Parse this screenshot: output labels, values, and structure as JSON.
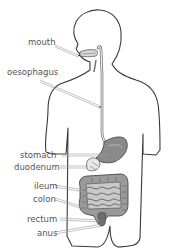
{
  "diagram": {
    "title": "",
    "type": "labelled anatomy diagram",
    "labels": [
      {
        "id": "mouth",
        "text": "mouth"
      },
      {
        "id": "oesophagus",
        "text": "oesophagus"
      },
      {
        "id": "stomach",
        "text": "stomach"
      },
      {
        "id": "duodenum",
        "text": "duodenum"
      },
      {
        "id": "ileum",
        "text": "ileum"
      },
      {
        "id": "colon",
        "text": "colon"
      },
      {
        "id": "rectum",
        "text": "rectum"
      },
      {
        "id": "anus",
        "text": "anus"
      }
    ],
    "colors": {
      "background": "#ffffff",
      "outline": "#3a3a3a",
      "label_text": "#555555",
      "organ_fill": "#8a8a8a",
      "organ_dark": "#5e5e5e",
      "leader": "#9a9a9a"
    }
  }
}
